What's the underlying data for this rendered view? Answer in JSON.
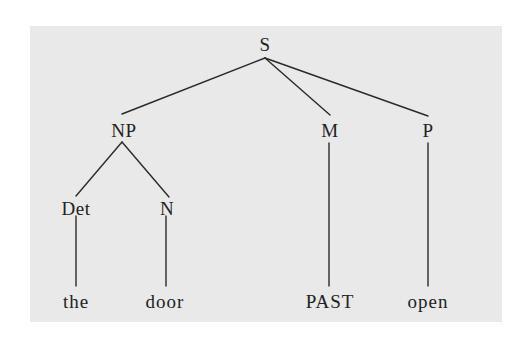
{
  "diagram": {
    "type": "syntax-tree",
    "background_color": "#e9e9e9",
    "line_color": "#2a2a2a",
    "text_color": "#222222",
    "nodes": [
      {
        "id": "S",
        "label": "S",
        "x": 265,
        "y": 44
      },
      {
        "id": "NP",
        "label": "NP",
        "x": 124,
        "y": 130
      },
      {
        "id": "M",
        "label": "M",
        "x": 330,
        "y": 130
      },
      {
        "id": "P",
        "label": "P",
        "x": 428,
        "y": 130
      },
      {
        "id": "Det",
        "label": "Det",
        "x": 76,
        "y": 208
      },
      {
        "id": "N",
        "label": "N",
        "x": 167,
        "y": 208
      },
      {
        "id": "the",
        "label": "the",
        "x": 76,
        "y": 301
      },
      {
        "id": "door",
        "label": "door",
        "x": 165,
        "y": 301
      },
      {
        "id": "PAST",
        "label": "PAST",
        "x": 330,
        "y": 301
      },
      {
        "id": "open",
        "label": "open",
        "x": 428,
        "y": 301
      }
    ],
    "edges": [
      {
        "from": "S",
        "to": "NP",
        "x1": 265,
        "y1": 58,
        "x2": 122,
        "y2": 114
      },
      {
        "from": "S",
        "to": "M",
        "x1": 265,
        "y1": 58,
        "x2": 330,
        "y2": 115
      },
      {
        "from": "S",
        "to": "P",
        "x1": 265,
        "y1": 58,
        "x2": 428,
        "y2": 116
      },
      {
        "from": "NP",
        "to": "Det",
        "x1": 122,
        "y1": 142,
        "x2": 76,
        "y2": 196
      },
      {
        "from": "NP",
        "to": "N",
        "x1": 122,
        "y1": 142,
        "x2": 169,
        "y2": 197
      },
      {
        "from": "Det",
        "to": "the",
        "x1": 76,
        "y1": 216,
        "x2": 76,
        "y2": 286
      },
      {
        "from": "N",
        "to": "door",
        "x1": 166,
        "y1": 216,
        "x2": 166,
        "y2": 286
      },
      {
        "from": "M",
        "to": "PAST",
        "x1": 329,
        "y1": 143,
        "x2": 329,
        "y2": 286
      },
      {
        "from": "P",
        "to": "open",
        "x1": 428,
        "y1": 143,
        "x2": 428,
        "y2": 286
      }
    ]
  }
}
